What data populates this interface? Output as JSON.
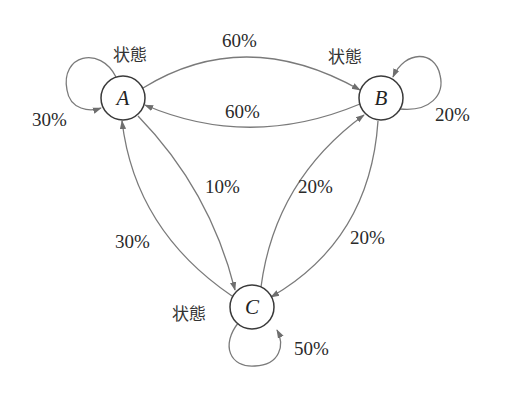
{
  "diagram": {
    "type": "state-transition",
    "nodes": [
      {
        "id": "A",
        "label": "A",
        "state_label": "状態",
        "self_prob": "30%"
      },
      {
        "id": "B",
        "label": "B",
        "state_label": "状態",
        "self_prob": "20%"
      },
      {
        "id": "C",
        "label": "C",
        "state_label": "状態",
        "self_prob": "50%"
      }
    ],
    "edges": [
      {
        "from": "A",
        "to": "B",
        "label": "60%"
      },
      {
        "from": "B",
        "to": "A",
        "label": "60%"
      },
      {
        "from": "A",
        "to": "C",
        "label": "10%"
      },
      {
        "from": "C",
        "to": "A",
        "label": "30%"
      },
      {
        "from": "C",
        "to": "B",
        "label": "20%"
      },
      {
        "from": "B",
        "to": "C",
        "label": "20%"
      },
      {
        "from": "A",
        "to": "A",
        "label": "30%"
      },
      {
        "from": "B",
        "to": "B",
        "label": "20%"
      },
      {
        "from": "C",
        "to": "C",
        "label": "50%"
      }
    ],
    "colors": {
      "edge": "#7a7a7a",
      "node_stroke": "#3a3a3a",
      "text": "#2a2a2a"
    }
  }
}
